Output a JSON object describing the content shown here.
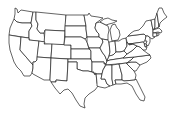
{
  "map": {
    "type": "blank-outline",
    "region": "Contiguous United States",
    "style": {
      "fill": "#ffffff",
      "stroke": "#222222",
      "background": "#ffffff"
    },
    "states": [
      "WA",
      "OR",
      "CA",
      "ID",
      "NV",
      "MT",
      "WY",
      "UT",
      "AZ",
      "CO",
      "NM",
      "ND",
      "SD",
      "NE",
      "KS",
      "OK",
      "TX",
      "MN",
      "IA",
      "MO",
      "AR",
      "LA",
      "WI",
      "IL",
      "MI",
      "IN",
      "OH",
      "KY",
      "TN",
      "MS",
      "AL",
      "GA",
      "FL",
      "SC",
      "NC",
      "VA",
      "WV",
      "PA",
      "NY",
      "VT",
      "NH",
      "ME",
      "MA",
      "CT",
      "RI",
      "NJ",
      "DE",
      "MD"
    ]
  }
}
